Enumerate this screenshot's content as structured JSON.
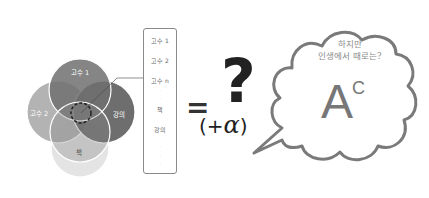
{
  "venn": {
    "circles": [
      {
        "label": "고수 1",
        "color": "#6f6f6f"
      },
      {
        "label": "고수 2",
        "color": "#a9a9a9"
      },
      {
        "label": "강의",
        "color": "#5e5e5e"
      },
      {
        "label": "책",
        "color": "#e4e4e4"
      }
    ],
    "center_marker": "dashed-circle"
  },
  "list": {
    "items": [
      "고수 1",
      "고수 2",
      "고수 n",
      "·",
      "·",
      "책",
      "강의",
      "·",
      "·",
      "·"
    ]
  },
  "equation": {
    "equals": "=",
    "question": "?",
    "plus_alpha_open": "(+",
    "alpha": "α",
    "plus_alpha_close": ")"
  },
  "bubble": {
    "line1": "하지만",
    "line2": "인생에서 때로는?",
    "grade_main": "A",
    "grade_sup": "C"
  }
}
